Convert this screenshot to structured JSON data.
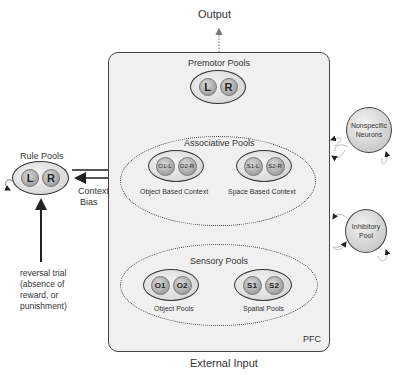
{
  "diagram": {
    "output_label": "Output",
    "external_input_label": "External Input",
    "pfc_label": "PFC",
    "premotor": {
      "title": "Premotor Pools",
      "nodes": [
        "L",
        "R"
      ]
    },
    "associative": {
      "title": "Associative Pools",
      "object_context": {
        "label": "Object Based Context",
        "nodes": [
          "O1-L",
          "O2-R"
        ]
      },
      "space_context": {
        "label": "Space Based Context",
        "nodes": [
          "S1-L",
          "S2-R"
        ]
      }
    },
    "sensory": {
      "title": "Sensory Pools",
      "object_pools": {
        "label": "Object Pools",
        "nodes": [
          "O1",
          "O2"
        ]
      },
      "spatial_pools": {
        "label": "Spatial Pools",
        "nodes": [
          "S1",
          "S2"
        ]
      }
    },
    "rule": {
      "title": "Rule Pools",
      "nodes": [
        "L",
        "R"
      ]
    },
    "context_bias_label": [
      "Context",
      "Bias"
    ],
    "reversal_label": [
      "reversal trial",
      "(absence of",
      "reward, or",
      "punishment)"
    ],
    "nonspecific": [
      "Nonspecific",
      "Neurons"
    ],
    "inhibitory": [
      "Inhibitory",
      "Pool"
    ],
    "colors": {
      "pfc_fill": "#f0f0f0",
      "stroke": "#333333",
      "node_fill": "#a8a8a8"
    }
  }
}
